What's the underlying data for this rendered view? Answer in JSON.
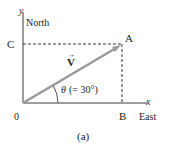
{
  "diagram": {
    "caption": "(a)",
    "axes": {
      "x_label": "x",
      "x_direction": "East",
      "y_label": "y",
      "y_direction": "North",
      "origin_label": "0"
    },
    "points": {
      "A": "A",
      "B": "B",
      "C": "C"
    },
    "vector": {
      "label": "V",
      "arrow_symbol": "→",
      "color": "#9a9a9a"
    },
    "angle": {
      "symbol": "θ",
      "annotation": "(= 30°)",
      "degrees": 30
    },
    "colors": {
      "ink": "#231f20",
      "vector": "#9a9a9a",
      "background": "#ffffff"
    }
  }
}
